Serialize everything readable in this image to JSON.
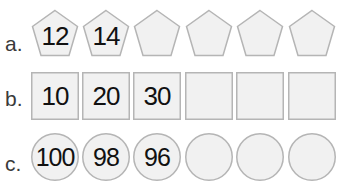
{
  "rows": [
    {
      "label": "a.",
      "shape": "pentagon",
      "values": [
        "12",
        "14",
        "",
        "",
        "",
        ""
      ]
    },
    {
      "label": "b.",
      "shape": "square",
      "values": [
        "10",
        "20",
        "30",
        "",
        "",
        ""
      ]
    },
    {
      "label": "c.",
      "shape": "circle",
      "values": [
        "100",
        "98",
        "96",
        "",
        "",
        ""
      ]
    }
  ],
  "colors": {
    "fill": "#f1f1f1",
    "stroke": "#b5b5b5",
    "text": "#111111",
    "label": "#3a3a3a"
  }
}
